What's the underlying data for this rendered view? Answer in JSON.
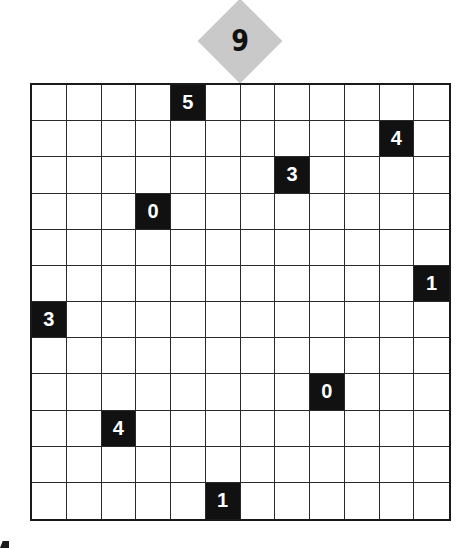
{
  "puzzle": {
    "number": "9",
    "rows": 12,
    "cols": 12,
    "colors": {
      "badge": "#c9c9c9",
      "clue_cell": "#111111",
      "clue_text": "#ffffff",
      "grid_line": "#2a2a2a"
    },
    "clues": [
      {
        "row": 0,
        "col": 4,
        "value": "5"
      },
      {
        "row": 1,
        "col": 10,
        "value": "4"
      },
      {
        "row": 2,
        "col": 7,
        "value": "3"
      },
      {
        "row": 3,
        "col": 3,
        "value": "0"
      },
      {
        "row": 5,
        "col": 11,
        "value": "1"
      },
      {
        "row": 6,
        "col": 0,
        "value": "3"
      },
      {
        "row": 8,
        "col": 8,
        "value": "0"
      },
      {
        "row": 9,
        "col": 2,
        "value": "4"
      },
      {
        "row": 11,
        "col": 5,
        "value": "1"
      }
    ]
  }
}
